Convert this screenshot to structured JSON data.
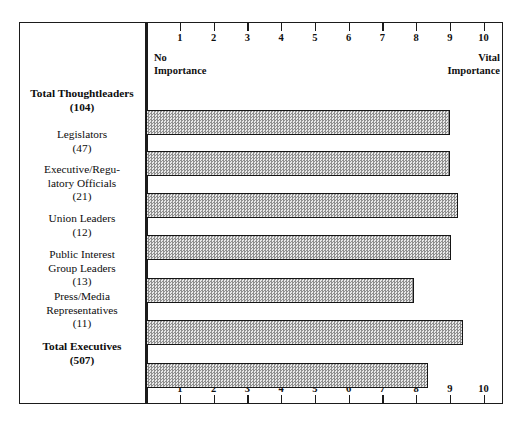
{
  "chart_data": {
    "type": "bar",
    "orientation": "horizontal",
    "title": "",
    "subtitle": "",
    "xlabel": "",
    "ylabel": "",
    "xlim": [
      0,
      10.5
    ],
    "grid": false,
    "legend": false,
    "axis": {
      "tick_labels": [
        "1",
        "2",
        "3",
        "4",
        "5",
        "6",
        "7",
        "8",
        "9",
        "10"
      ],
      "tick_values": [
        1,
        2,
        3,
        4,
        5,
        6,
        7,
        8,
        9,
        10
      ],
      "top_axis": true,
      "bottom_axis": true,
      "anchor_low_line1": "No",
      "anchor_low_line2": "Importance",
      "anchor_high_line1": "Vital",
      "anchor_high_line2": "Importance"
    },
    "categories": [
      "Total Thoughtleaders",
      "Legislators",
      "Executive/Regulatory Officials",
      "Union Leaders",
      "Public Interest Group Leaders",
      "Press/Media Representatives",
      "Total Executives"
    ],
    "values": [
      9.0,
      9.0,
      9.25,
      9.05,
      7.95,
      9.4,
      8.35
    ],
    "base_counts": [
      104,
      47,
      21,
      12,
      13,
      11,
      507
    ],
    "bars": [
      {
        "label_lines": [
          "Total Thoughtleaders"
        ],
        "count": "(104)",
        "value": 9.0,
        "bold": true
      },
      {
        "label_lines": [
          "Legislators"
        ],
        "count": "(47)",
        "value": 9.0,
        "bold": false
      },
      {
        "label_lines": [
          "Executive/Regu-",
          "latory Officials"
        ],
        "count": "(21)",
        "value": 9.25,
        "bold": false
      },
      {
        "label_lines": [
          "Union Leaders"
        ],
        "count": "(12)",
        "value": 9.05,
        "bold": false
      },
      {
        "label_lines": [
          "Public Interest",
          "Group Leaders"
        ],
        "count": "(13)",
        "value": 7.95,
        "bold": false
      },
      {
        "label_lines": [
          "Press/Media",
          "Representatives"
        ],
        "count": "(11)",
        "value": 9.4,
        "bold": false
      },
      {
        "label_lines": [
          "Total Executives"
        ],
        "count": "(507)",
        "value": 8.35,
        "bold": true
      }
    ],
    "colors": {
      "bar_fill": "#c9c9c9",
      "bar_border": "#151515",
      "frame": "#1b1b1b",
      "text": "#101010",
      "background": "#ffffff"
    }
  }
}
